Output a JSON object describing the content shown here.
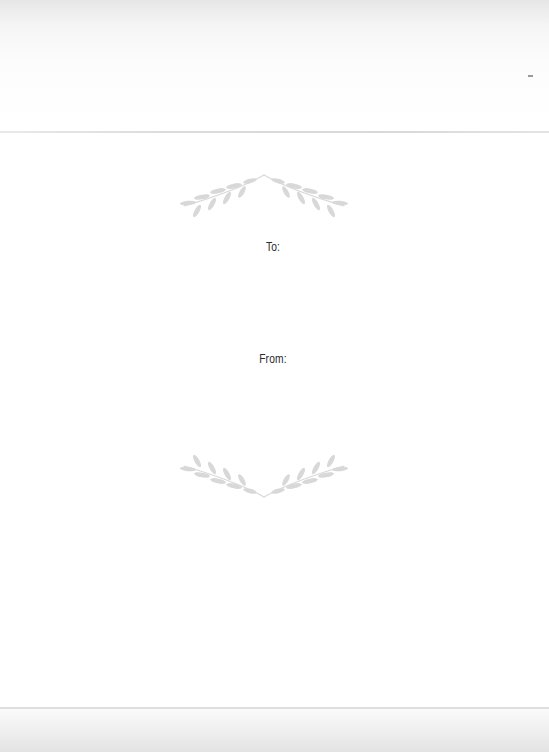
{
  "gift_tag": {
    "to_label": "To:",
    "from_label": "From:",
    "top_ornament": "laurel-branches-icon",
    "bottom_ornament": "laurel-branches-icon",
    "colors": {
      "ornament": "#d6d6d6",
      "label_text": "#2b2b2b",
      "paper": "#ffffff"
    }
  }
}
